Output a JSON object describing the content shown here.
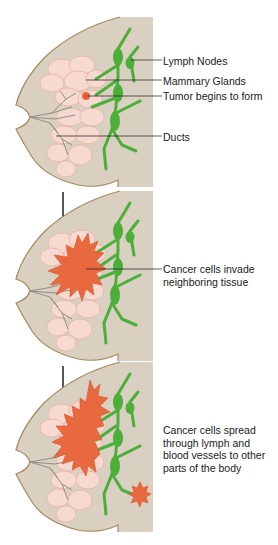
{
  "colors": {
    "background": "#ffffff",
    "panel": "#d9d0c1",
    "outline": "#a8895c",
    "lymph": "#4caf3a",
    "lymph_dark": "#3e9a2f",
    "gland_fill": "#f6d9d0",
    "gland_stroke": "#e8b3a6",
    "duct": "#8f8f86",
    "tumor": "#e8693e",
    "tumor_dark": "#d9532a",
    "leader": "#1a1a1a",
    "arrow": "#111111"
  },
  "panels": [
    {
      "id": "stage-1",
      "labels": [
        {
          "text": "Lymph Nodes",
          "y": 55
        },
        {
          "text": "Mammary Glands",
          "y": 75
        },
        {
          "text": "Tumor begins to form",
          "y": 90
        },
        {
          "text": "Ducts",
          "y": 131
        }
      ]
    },
    {
      "id": "stage-2",
      "labels": [
        {
          "text": "Cancer cells invade\nneighboring tissue",
          "y": 267
        }
      ]
    },
    {
      "id": "stage-3",
      "labels": [
        {
          "text": "Cancer cells spread\nthrough lymph and\nblood vessels to other\nparts of the body",
          "y": 426
        }
      ]
    }
  ],
  "arrows": [
    {
      "from": "stage-1",
      "to": "stage-2",
      "icon": "down-arrow-icon"
    },
    {
      "from": "stage-2",
      "to": "stage-3",
      "icon": "down-arrow-icon"
    }
  ]
}
